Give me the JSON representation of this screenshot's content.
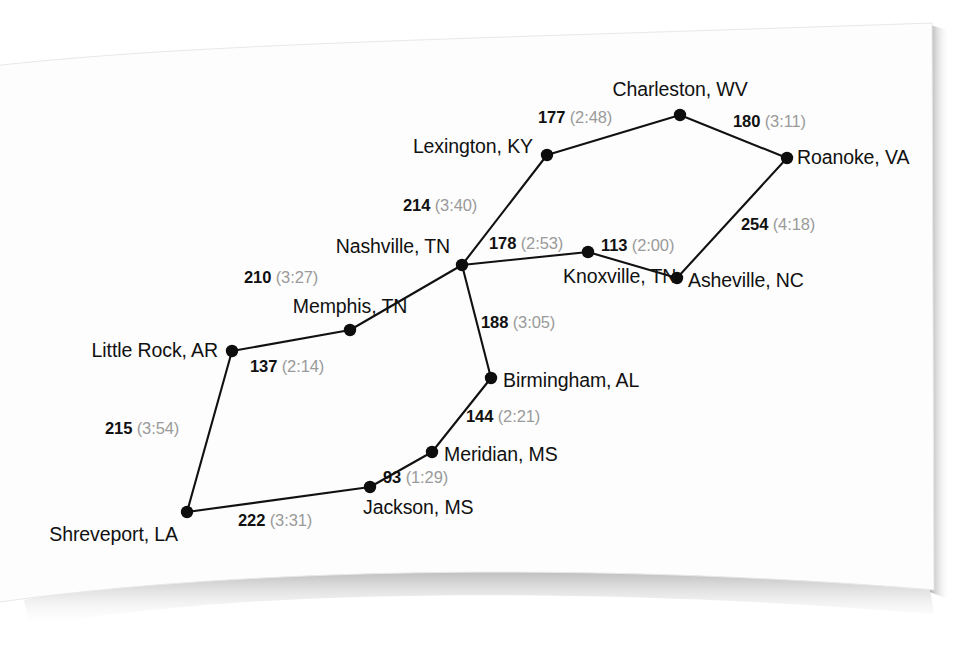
{
  "page": {
    "background_color": "#ffffff",
    "paper_color": "#fdfdfd",
    "shadow_color": "#b9b9b9",
    "line_color": "#111111",
    "node_color": "#0d0d0d",
    "distance_color": "#111111",
    "time_color": "#9a9a9a"
  },
  "chart_data": {
    "type": "diagram",
    "subtype": "weighted-graph-road-map",
    "title": "",
    "units": {
      "distance": "miles",
      "time": "hours:minutes"
    },
    "nodes": [
      {
        "id": "little_rock",
        "label": "Little Rock, AR",
        "x": 232,
        "y": 351,
        "label_x": 218,
        "label_y": 351,
        "anchor": "e"
      },
      {
        "id": "memphis",
        "label": "Memphis, TN",
        "x": 350,
        "y": 330,
        "label_x": 350,
        "label_y": 307,
        "anchor": "c"
      },
      {
        "id": "nashville",
        "label": "Nashville, TN",
        "x": 462,
        "y": 265,
        "label_x": 450,
        "label_y": 247,
        "anchor": "e"
      },
      {
        "id": "lexington",
        "label": "Lexington, KY",
        "x": 547,
        "y": 155,
        "label_x": 533,
        "label_y": 147,
        "anchor": "e"
      },
      {
        "id": "charleston",
        "label": "Charleston, WV",
        "x": 680,
        "y": 115,
        "label_x": 680,
        "label_y": 90,
        "anchor": "c"
      },
      {
        "id": "roanoke",
        "label": "Roanoke, VA",
        "x": 787,
        "y": 158,
        "label_x": 797,
        "label_y": 158,
        "anchor": "w"
      },
      {
        "id": "asheville",
        "label": "Asheville, NC",
        "x": 677,
        "y": 278,
        "label_x": 688,
        "label_y": 281,
        "anchor": "w"
      },
      {
        "id": "knoxville",
        "label": "Knoxville, TN",
        "x": 588,
        "y": 252,
        "label_x": 563,
        "label_y": 277,
        "anchor": "w"
      },
      {
        "id": "birmingham",
        "label": "Birmingham, AL",
        "x": 491,
        "y": 378,
        "label_x": 503,
        "label_y": 381,
        "anchor": "w"
      },
      {
        "id": "meridian",
        "label": "Meridian, MS",
        "x": 432,
        "y": 452,
        "label_x": 444,
        "label_y": 455,
        "anchor": "w"
      },
      {
        "id": "jackson",
        "label": "Jackson, MS",
        "x": 370,
        "y": 487,
        "label_x": 363,
        "label_y": 508,
        "anchor": "w"
      },
      {
        "id": "shreveport",
        "label": "Shreveport, LA",
        "x": 187,
        "y": 512,
        "label_x": 178,
        "label_y": 535,
        "anchor": "e"
      }
    ],
    "edges": [
      {
        "from": "little_rock",
        "to": "memphis",
        "distance": "137",
        "time": "(2:14)",
        "label_x": 250,
        "label_y": 366,
        "anchor": "w"
      },
      {
        "from": "memphis",
        "to": "nashville",
        "distance": "210",
        "time": "(3:27)",
        "label_x": 244,
        "label_y": 277,
        "anchor": "w"
      },
      {
        "from": "nashville",
        "to": "lexington",
        "distance": "214",
        "time": "(3:40)",
        "label_x": 403,
        "label_y": 205,
        "anchor": "w"
      },
      {
        "from": "lexington",
        "to": "charleston",
        "distance": "177",
        "time": "(2:48)",
        "label_x": 538,
        "label_y": 117,
        "anchor": "w"
      },
      {
        "from": "charleston",
        "to": "roanoke",
        "distance": "180",
        "time": "(3:11)",
        "label_x": 733,
        "label_y": 121,
        "anchor": "w"
      },
      {
        "from": "roanoke",
        "to": "asheville",
        "distance": "254",
        "time": "(4:18)",
        "label_x": 741,
        "label_y": 224,
        "anchor": "w"
      },
      {
        "from": "asheville",
        "to": "knoxville",
        "distance": "113",
        "time": "(2:00)",
        "label_x": 601,
        "label_y": 245,
        "anchor": "w"
      },
      {
        "from": "knoxville",
        "to": "nashville",
        "distance": "178",
        "time": "(2:53)",
        "label_x": 489,
        "label_y": 243,
        "anchor": "w"
      },
      {
        "from": "nashville",
        "to": "birmingham",
        "distance": "188",
        "time": "(3:05)",
        "label_x": 481,
        "label_y": 322,
        "anchor": "w"
      },
      {
        "from": "birmingham",
        "to": "meridian",
        "distance": "144",
        "time": "(2:21)",
        "label_x": 466,
        "label_y": 416,
        "anchor": "w"
      },
      {
        "from": "meridian",
        "to": "jackson",
        "distance": "93",
        "time": "(1:29)",
        "label_x": 383,
        "label_y": 477,
        "anchor": "w"
      },
      {
        "from": "jackson",
        "to": "shreveport",
        "distance": "222",
        "time": "(3:31)",
        "label_x": 238,
        "label_y": 520,
        "anchor": "w"
      },
      {
        "from": "shreveport",
        "to": "little_rock",
        "distance": "215",
        "time": "(3:54)",
        "label_x": 105,
        "label_y": 428,
        "anchor": "w"
      }
    ]
  }
}
